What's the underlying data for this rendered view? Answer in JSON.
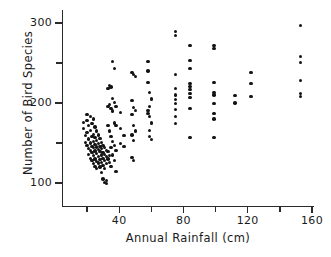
{
  "chart_data": {
    "type": "scatter",
    "title": "",
    "xlabel": "Annual Rainfall (cm)",
    "ylabel": "Number of Bird Species",
    "xlim": [
      10,
      165
    ],
    "ylim": [
      85,
      310
    ],
    "grid": false,
    "legend": null,
    "xticks_major": [
      40,
      80,
      120,
      160
    ],
    "xticks_minor": [
      20,
      60,
      100,
      140
    ],
    "yticks_major": [
      100,
      200,
      300
    ],
    "yticks_minor": [
      150,
      250
    ],
    "xtick_labels": [
      "40",
      "80",
      "120",
      "160"
    ],
    "ytick_labels": [
      "100",
      "200",
      "300"
    ],
    "points": [
      [
        18,
        176
      ],
      [
        18,
        168
      ],
      [
        19,
        159
      ],
      [
        19,
        151
      ],
      [
        20,
        186
      ],
      [
        20,
        178
      ],
      [
        20,
        163
      ],
      [
        20,
        147
      ],
      [
        21,
        172
      ],
      [
        21,
        155
      ],
      [
        21,
        143
      ],
      [
        21,
        136
      ],
      [
        22,
        183
      ],
      [
        22,
        166
      ],
      [
        22,
        150
      ],
      [
        22,
        141
      ],
      [
        22,
        131
      ],
      [
        23,
        174
      ],
      [
        23,
        158
      ],
      [
        23,
        146
      ],
      [
        23,
        138
      ],
      [
        23,
        128
      ],
      [
        24,
        180
      ],
      [
        24,
        161
      ],
      [
        24,
        152
      ],
      [
        24,
        144
      ],
      [
        24,
        134
      ],
      [
        24,
        124
      ],
      [
        25,
        170
      ],
      [
        25,
        157
      ],
      [
        25,
        148
      ],
      [
        25,
        140
      ],
      [
        25,
        130
      ],
      [
        25,
        121
      ],
      [
        26,
        165
      ],
      [
        26,
        153
      ],
      [
        26,
        145
      ],
      [
        26,
        137
      ],
      [
        26,
        127
      ],
      [
        26,
        118
      ],
      [
        27,
        160
      ],
      [
        27,
        149
      ],
      [
        27,
        142
      ],
      [
        27,
        133
      ],
      [
        27,
        125
      ],
      [
        28,
        156
      ],
      [
        28,
        146
      ],
      [
        28,
        139
      ],
      [
        28,
        129
      ],
      [
        28,
        120
      ],
      [
        29,
        151
      ],
      [
        29,
        143
      ],
      [
        29,
        135
      ],
      [
        29,
        126
      ],
      [
        29,
        113
      ],
      [
        30,
        147
      ],
      [
        30,
        138
      ],
      [
        30,
        131
      ],
      [
        30,
        122
      ],
      [
        30,
        105
      ],
      [
        31,
        144
      ],
      [
        31,
        136
      ],
      [
        31,
        128
      ],
      [
        31,
        118
      ],
      [
        31,
        101
      ],
      [
        32,
        141
      ],
      [
        32,
        133
      ],
      [
        32,
        124
      ],
      [
        32,
        103
      ],
      [
        32,
        99
      ],
      [
        33,
        218
      ],
      [
        33,
        196
      ],
      [
        33,
        172
      ],
      [
        33,
        139
      ],
      [
        33,
        130
      ],
      [
        34,
        222
      ],
      [
        34,
        198
      ],
      [
        34,
        165
      ],
      [
        34,
        134
      ],
      [
        34,
        126
      ],
      [
        35,
        220
      ],
      [
        35,
        193
      ],
      [
        35,
        158
      ],
      [
        35,
        144
      ],
      [
        35,
        121
      ],
      [
        36,
        252
      ],
      [
        36,
        206
      ],
      [
        36,
        190
      ],
      [
        36,
        152
      ],
      [
        36,
        135
      ],
      [
        37,
        243
      ],
      [
        37,
        201
      ],
      [
        37,
        175
      ],
      [
        37,
        147
      ],
      [
        37,
        128
      ],
      [
        38,
        196
      ],
      [
        38,
        172
      ],
      [
        38,
        141
      ],
      [
        38,
        114
      ],
      [
        41,
        188
      ],
      [
        41,
        168
      ],
      [
        41,
        149
      ],
      [
        43,
        159
      ],
      [
        43,
        146
      ],
      [
        48,
        238
      ],
      [
        48,
        203
      ],
      [
        48,
        186
      ],
      [
        48,
        160
      ],
      [
        48,
        132
      ],
      [
        49,
        236
      ],
      [
        49,
        194
      ],
      [
        49,
        172
      ],
      [
        49,
        153
      ],
      [
        49,
        128
      ],
      [
        50,
        233
      ],
      [
        50,
        191
      ],
      [
        50,
        165
      ],
      [
        58,
        252
      ],
      [
        58,
        240
      ],
      [
        58,
        226
      ],
      [
        58,
        191
      ],
      [
        58,
        187
      ],
      [
        59,
        213
      ],
      [
        59,
        196
      ],
      [
        59,
        183
      ],
      [
        59,
        166
      ],
      [
        59,
        158
      ],
      [
        60,
        205
      ],
      [
        60,
        175
      ],
      [
        60,
        154
      ],
      [
        75,
        289
      ],
      [
        75,
        284
      ],
      [
        75,
        236
      ],
      [
        75,
        218
      ],
      [
        75,
        210
      ],
      [
        75,
        204
      ],
      [
        75,
        199
      ],
      [
        75,
        192
      ],
      [
        75,
        183
      ],
      [
        75,
        174
      ],
      [
        84,
        272
      ],
      [
        84,
        253
      ],
      [
        84,
        243
      ],
      [
        84,
        224
      ],
      [
        84,
        221
      ],
      [
        84,
        217
      ],
      [
        84,
        212
      ],
      [
        84,
        207
      ],
      [
        84,
        193
      ],
      [
        84,
        157
      ],
      [
        99,
        272
      ],
      [
        99,
        268
      ],
      [
        99,
        226
      ],
      [
        99,
        213
      ],
      [
        99,
        210
      ],
      [
        99,
        199
      ],
      [
        99,
        187
      ],
      [
        99,
        180
      ],
      [
        99,
        157
      ],
      [
        112,
        209
      ],
      [
        112,
        200
      ],
      [
        122,
        238
      ],
      [
        122,
        224
      ],
      [
        122,
        208
      ],
      [
        153,
        297
      ],
      [
        153,
        258
      ],
      [
        153,
        251
      ],
      [
        153,
        228
      ],
      [
        153,
        212
      ],
      [
        153,
        208
      ]
    ]
  },
  "caption": {
    "text": ""
  }
}
